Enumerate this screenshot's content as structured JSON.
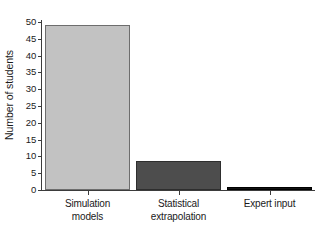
{
  "chart_data": {
    "type": "bar",
    "title": "",
    "xlabel": "",
    "ylabel": "Number of students",
    "categories": [
      "Simulation models",
      "Statistical extrapolation",
      "Expert input"
    ],
    "category_lines": [
      [
        "Simulation",
        "models"
      ],
      [
        "Statistical",
        "extrapolation"
      ],
      [
        "Expert input"
      ]
    ],
    "values": [
      49,
      8.5,
      1
    ],
    "ylim": [
      0,
      50
    ],
    "ytick_values": [
      0,
      5,
      10,
      15,
      20,
      25,
      30,
      35,
      40,
      45,
      50
    ],
    "ytick_labels": [
      "0",
      "5",
      "10",
      "15",
      "20",
      "25",
      "30",
      "35",
      "40",
      "45",
      "50"
    ],
    "grid": false,
    "legend": "none",
    "bar_colors": [
      "#c2c2c2",
      "#4d4d4d",
      "#121212"
    ],
    "bar_edge_colors": [
      "#6d6d6d",
      "#2e2e2e",
      "#000000"
    ]
  },
  "axes": {
    "spine_color": "#3b3b3b",
    "background": "#ffffff"
  }
}
